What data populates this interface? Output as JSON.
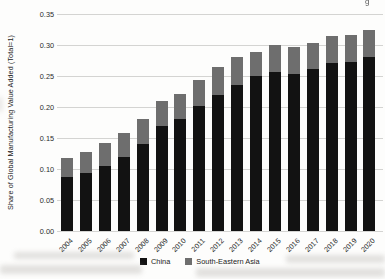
{
  "figure": {
    "title": "",
    "y_axis_title": "Share of Global Manufacturing Value Added (Total=1)"
  },
  "chart_data": {
    "type": "bar",
    "stacked": true,
    "title": "",
    "xlabel": "",
    "ylabel": "Share of Global Manufacturing Value Added (Total=1)",
    "ylim": [
      0,
      0.35
    ],
    "ytick_labels": [
      "0.00",
      "0.05",
      "0.10",
      "0.15",
      "0.20",
      "0.25",
      "0.30",
      "0.35"
    ],
    "grid": true,
    "legend_position": "bottom-center",
    "categories": [
      "2004",
      "2005",
      "2006",
      "2007",
      "2008",
      "2009",
      "2010",
      "2011",
      "2012",
      "2013",
      "2014",
      "2015",
      "2016",
      "2017",
      "2018",
      "2019",
      "2020"
    ],
    "series": [
      {
        "name": "China",
        "color": "#121212",
        "values": [
          0.087,
          0.094,
          0.105,
          0.119,
          0.14,
          0.169,
          0.181,
          0.201,
          0.219,
          0.236,
          0.25,
          0.256,
          0.254,
          0.261,
          0.271,
          0.272,
          0.28
        ]
      },
      {
        "name": "South-Eastern Asia",
        "color": "#6e6e6e",
        "values": [
          0.031,
          0.033,
          0.037,
          0.039,
          0.04,
          0.041,
          0.04,
          0.043,
          0.045,
          0.044,
          0.038,
          0.044,
          0.043,
          0.043,
          0.044,
          0.044,
          0.045
        ]
      }
    ],
    "totals": [
      0.118,
      0.127,
      0.142,
      0.158,
      0.18,
      0.21,
      0.221,
      0.244,
      0.264,
      0.28,
      0.288,
      0.3,
      0.297,
      0.304,
      0.315,
      0.316,
      0.325
    ]
  },
  "legend": {
    "items": [
      {
        "label": "China",
        "color": "#121212"
      },
      {
        "label": "South-Eastern Asia",
        "color": "#6e6e6e"
      }
    ]
  },
  "artifacts": {
    "top_right_fragment": "g"
  }
}
